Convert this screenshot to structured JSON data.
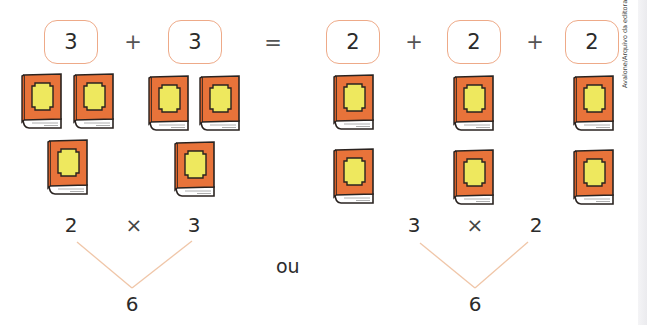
{
  "addition_equation": {
    "left_boxes": [
      "3",
      "3"
    ],
    "plus_1": "+",
    "equals": "=",
    "right_boxes": [
      "2",
      "2",
      "2"
    ],
    "plus_2": "+",
    "plus_3": "+"
  },
  "book_groups": {
    "left": [
      {
        "label": "group-of-3-a",
        "count": 3
      },
      {
        "label": "group-of-3-b",
        "count": 3
      }
    ],
    "right": [
      {
        "label": "group-of-2-a",
        "count": 2
      },
      {
        "label": "group-of-2-b",
        "count": 2
      },
      {
        "label": "group-of-2-c",
        "count": 2
      }
    ],
    "book_colors": {
      "cover": "#e8733a",
      "label": "#eee85e",
      "outline": "#2a2320",
      "pages": "#ffffff"
    }
  },
  "multiplication_left": {
    "factor_a": "2",
    "operator": "×",
    "factor_b": "3",
    "product": "6"
  },
  "connector_word": "ou",
  "multiplication_right": {
    "factor_a": "3",
    "operator": "×",
    "factor_b": "2",
    "product": "6"
  },
  "credit": "Avalone/Arquivo da editora",
  "colors": {
    "box_border": "#eeaa88",
    "tree_lines": "#f0c6a8"
  }
}
